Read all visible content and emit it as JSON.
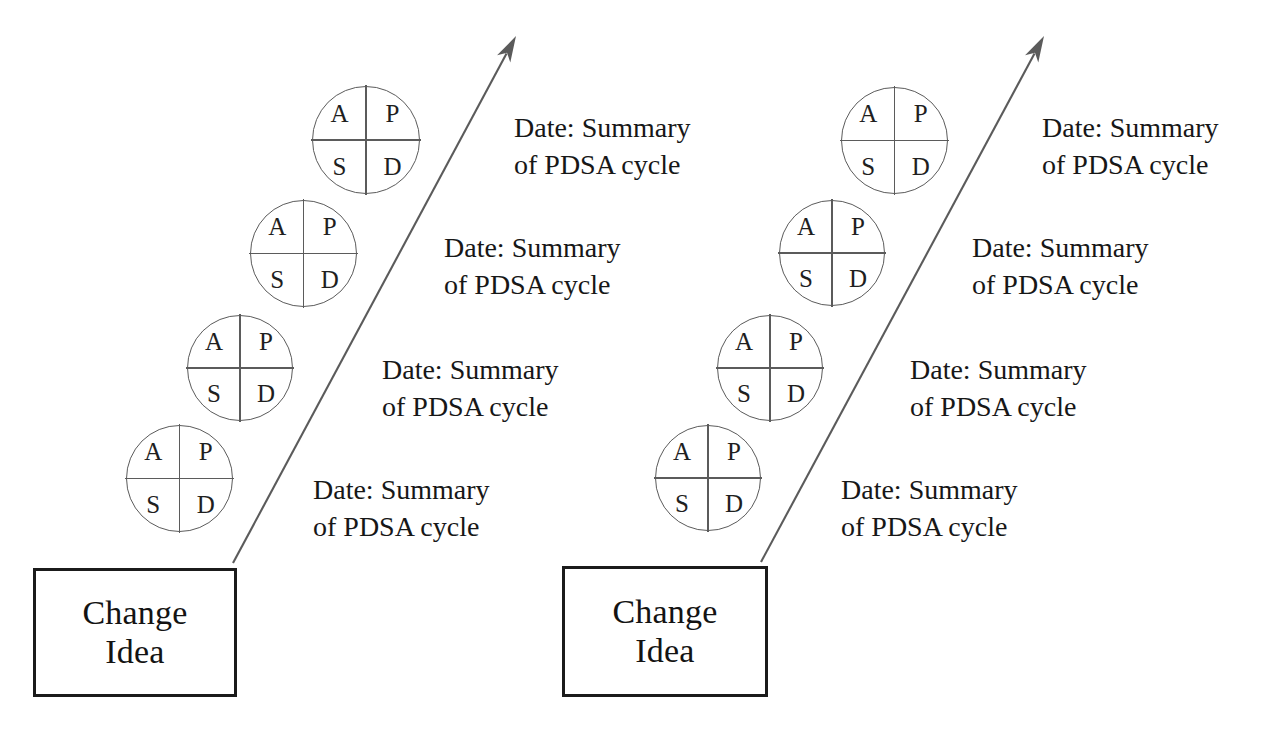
{
  "diagram": {
    "line_color": "#5b5b5b",
    "box_border_color": "#1b1b1b",
    "text_color": "#171717",
    "background": "#ffffff"
  },
  "labels": {
    "pdsa_plan": "P",
    "pdsa_do": "D",
    "pdsa_study": "S",
    "pdsa_act": "A",
    "change_idea_line1": "Change",
    "change_idea_line2": "Idea",
    "summary_line1": "Date: Summary",
    "summary_line2": "of PDSA cycle"
  },
  "groups": [
    {
      "id": "ramp-left",
      "change_box": {
        "x": 33,
        "y": 568,
        "w": 204,
        "h": 129
      },
      "arrow": {
        "x1": 233,
        "y1": 563,
        "x2": 516,
        "y2": 36
      },
      "cycles": [
        {
          "circle": {
            "x": 126,
            "y": 425,
            "d": 107
          },
          "summary": {
            "x": 313,
            "y": 472
          }
        },
        {
          "circle": {
            "x": 187,
            "y": 315,
            "d": 106
          },
          "summary": {
            "x": 382,
            "y": 352
          }
        },
        {
          "circle": {
            "x": 250,
            "y": 200,
            "d": 107
          },
          "summary": {
            "x": 444,
            "y": 230
          }
        },
        {
          "circle": {
            "x": 312,
            "y": 86,
            "d": 108
          },
          "summary": {
            "x": 514,
            "y": 110
          }
        }
      ]
    },
    {
      "id": "ramp-right",
      "change_box": {
        "x": 562,
        "y": 566,
        "w": 206,
        "h": 131
      },
      "arrow": {
        "x1": 761,
        "y1": 562,
        "x2": 1044,
        "y2": 36
      },
      "cycles": [
        {
          "circle": {
            "x": 655,
            "y": 425,
            "d": 106
          },
          "summary": {
            "x": 841,
            "y": 472
          }
        },
        {
          "circle": {
            "x": 779,
            "y": 200,
            "d": 106
          },
          "summary": {
            "x": 910,
            "y": 352
          }
        },
        {
          "circle": {
            "x": 717,
            "y": 315,
            "d": 106
          },
          "summary": {
            "x": 972,
            "y": 230
          }
        },
        {
          "circle": {
            "x": 841,
            "y": 87,
            "d": 107
          },
          "summary": {
            "x": 1042,
            "y": 110
          }
        }
      ]
    }
  ]
}
